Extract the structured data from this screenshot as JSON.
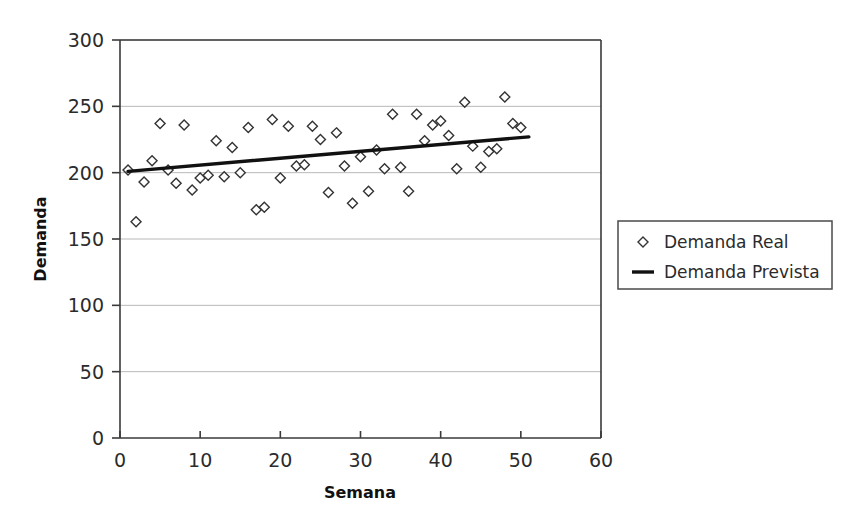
{
  "chart_data": {
    "type": "scatter",
    "title": "",
    "subtitle": "",
    "xlabel": "Semana",
    "ylabel": "Demanda",
    "xlim": [
      0,
      60
    ],
    "ylim": [
      0,
      300
    ],
    "xticks": [
      0,
      10,
      20,
      30,
      40,
      50,
      60
    ],
    "yticks": [
      0,
      50,
      100,
      150,
      200,
      250,
      300
    ],
    "xtick_labels": [
      "0",
      "10",
      "20",
      "30",
      "40",
      "50",
      "60"
    ],
    "ytick_labels": [
      "0",
      "50",
      "100",
      "150",
      "200",
      "250",
      "300"
    ],
    "grid": "horizontal",
    "legend_position": "right",
    "series": [
      {
        "name": "Demanda Real",
        "type": "scatter",
        "marker": "diamond-open",
        "color": "#333333",
        "x": [
          1,
          2,
          3,
          4,
          5,
          6,
          7,
          8,
          9,
          10,
          11,
          12,
          13,
          14,
          15,
          16,
          17,
          18,
          19,
          20,
          21,
          22,
          23,
          24,
          25,
          26,
          27,
          28,
          29,
          30,
          31,
          32,
          33,
          34,
          35,
          36,
          37,
          38,
          39,
          40,
          41,
          42,
          43,
          44,
          45,
          46,
          47,
          48,
          49,
          50
        ],
        "y": [
          202,
          163,
          193,
          209,
          237,
          202,
          192,
          236,
          187,
          196,
          198,
          224,
          197,
          219,
          200,
          234,
          172,
          174,
          240,
          196,
          235,
          205,
          206,
          235,
          225,
          185,
          230,
          205,
          177,
          212,
          186,
          217,
          203,
          244,
          204,
          186,
          244,
          224,
          236,
          239,
          228,
          203,
          253,
          220,
          204,
          216,
          218,
          257,
          237,
          234
        ]
      },
      {
        "name": "Demanda Prevista",
        "type": "line",
        "marker": "none",
        "color": "#111111",
        "x": [
          1,
          51
        ],
        "y": [
          201,
          227
        ]
      }
    ]
  },
  "legend": {
    "entries": [
      {
        "label": "Demanda Real",
        "marker": "diamond-icon"
      },
      {
        "label": "Demanda Prevista",
        "marker": "line-icon"
      }
    ]
  },
  "axes": {
    "x_title": "Semana",
    "y_title": "Demanda"
  },
  "colors": {
    "background": "#ffffff",
    "grid": "#b9b9b9",
    "frame": "#3a3a3a",
    "marker_stroke": "#333333",
    "marker_fill": "#ffffff",
    "trendline": "#111111",
    "text": "#2b2b2b"
  }
}
